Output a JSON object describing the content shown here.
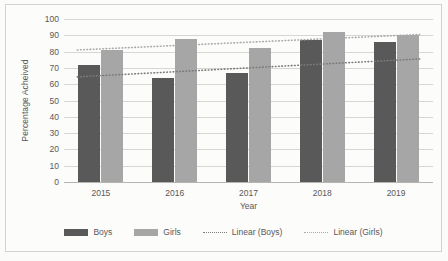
{
  "chart_data": {
    "type": "bar",
    "title": "",
    "xlabel": "Year",
    "ylabel": "Percentage Acheived",
    "categories": [
      "2015",
      "2016",
      "2017",
      "2018",
      "2019"
    ],
    "ylim": [
      0,
      100
    ],
    "yticks": [
      "100",
      "90",
      "80",
      "70",
      "60",
      "50",
      "40",
      "30",
      "20",
      "10",
      "0"
    ],
    "grid": true,
    "legend_position": "bottom",
    "series": [
      {
        "name": "Boys",
        "type": "bar",
        "color": "#595959",
        "values": [
          72,
          64,
          67,
          87,
          86
        ]
      },
      {
        "name": "Girls",
        "type": "bar",
        "color": "#a6a6a6",
        "values": [
          81,
          88,
          82,
          92,
          90
        ]
      },
      {
        "name": "Linear (Boys)",
        "type": "trendline",
        "style": "dotted",
        "color": "#7b7b7b",
        "endpoints": [
          64.5,
          75.5
        ]
      },
      {
        "name": "Linear (Girls)",
        "type": "trendline",
        "style": "dotted",
        "color": "#a9a9a9",
        "endpoints": [
          81.0,
          90.5
        ]
      }
    ]
  },
  "legend": {
    "items": [
      {
        "label": "Boys",
        "marker": "bar-swatch-dark"
      },
      {
        "label": "Girls",
        "marker": "bar-swatch-light"
      },
      {
        "label": "Linear (Boys)",
        "marker": "dotted-line-dark"
      },
      {
        "label": "Linear (Girls)",
        "marker": "dotted-line-light"
      }
    ]
  }
}
